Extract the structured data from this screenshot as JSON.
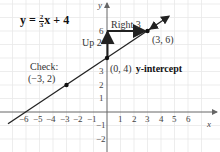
{
  "equation": {
    "lhs": "y = ",
    "num": "2",
    "den": "3",
    "rhs": "x + 4"
  },
  "axes": {
    "x_label": "x",
    "y_label": "y",
    "x_ticks_neg": [
      "−6",
      "−5",
      "−4",
      "−3",
      "−2",
      "−1"
    ],
    "x_ticks_pos": [
      "1",
      "2",
      "3",
      "4",
      "5",
      "6"
    ],
    "y_ticks": [
      "6",
      "3",
      "2",
      "1",
      "−1",
      "−2"
    ]
  },
  "annotations": {
    "right": "Right 3",
    "up": "Up 2",
    "point_end": "(3, 6)",
    "intercept_coords": "(0, 4)",
    "intercept_label": "y-intercept",
    "check_label": "Check:",
    "check_point": "(−3, 2)"
  },
  "colors": {
    "grid": "#e6e6e6",
    "axis": "#555555",
    "line": "#222222"
  }
}
